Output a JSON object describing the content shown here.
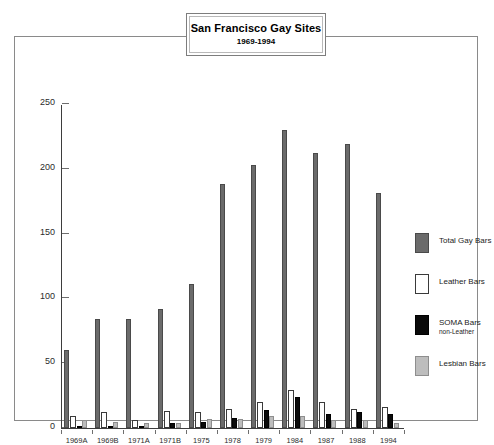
{
  "chart_data": {
    "type": "bar",
    "title": "San Francisco Gay Sites",
    "subtitle": "1969-1994",
    "xlabel": "",
    "ylabel": "",
    "ylim": [
      0,
      250
    ],
    "yticks": [
      0,
      50,
      100,
      150,
      200,
      250
    ],
    "grid": false,
    "legend_position": "right",
    "categories": [
      "1969A",
      "1969B",
      "1971A",
      "1971B",
      "1975",
      "1978",
      "1979",
      "1984",
      "1987",
      "1988",
      "1994"
    ],
    "series": [
      {
        "name": "Total Gay Bars",
        "color": "#6b6b6b",
        "values": [
          60,
          84,
          84,
          92,
          111,
          188,
          203,
          230,
          212,
          219,
          181
        ]
      },
      {
        "name": "Leather Bars",
        "color": "#ffffff",
        "values": [
          9,
          12,
          6,
          13,
          12,
          15,
          20,
          29,
          20,
          15,
          16
        ]
      },
      {
        "name": "SOMA Bars",
        "sublabel": "non-Leather",
        "color": "#0a0a0a",
        "values": [
          1,
          1,
          1,
          4,
          5,
          8,
          14,
          24,
          11,
          12,
          11
        ]
      },
      {
        "name": "Lesbian Bars",
        "color": "#bdbdbd",
        "values": [
          6,
          5,
          4,
          4,
          7,
          7,
          9,
          9,
          6,
          6,
          4
        ]
      }
    ]
  },
  "legend": {
    "items": [
      {
        "label": "Total Gay Bars",
        "sub": "",
        "swatch": "total"
      },
      {
        "label": "Leather Bars",
        "sub": "",
        "swatch": "leather"
      },
      {
        "label": "SOMA Bars",
        "sub": "non-Leather",
        "swatch": "soma"
      },
      {
        "label": "Lesbian Bars",
        "sub": "",
        "swatch": "lesbian"
      }
    ]
  }
}
